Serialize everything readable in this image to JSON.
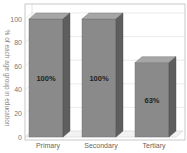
{
  "chart_data": {
    "type": "bar",
    "style": "3d",
    "title": "",
    "categories": [
      "Primary",
      "Secondary",
      "Tertiary"
    ],
    "values": [
      100,
      100,
      63
    ],
    "value_labels": [
      "100%",
      "100%",
      "63%"
    ],
    "xlabel": "",
    "ylabel": "% of each age group in education",
    "ylim": [
      0,
      100
    ],
    "yticks": [
      0,
      20,
      40,
      60,
      80,
      100
    ],
    "grid": true,
    "legend": null,
    "colors": {
      "bar_front": "#8a8a8a",
      "bar_top": "#a6a6a6",
      "bar_side": "#5e5e5e",
      "grid": "#dcdcdc",
      "frame": "#bbbbbb",
      "floor": "#f2f2f2"
    }
  }
}
